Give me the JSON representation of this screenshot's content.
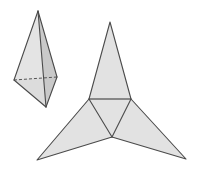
{
  "figure": {
    "title": "Tetrahedron and its net",
    "canvas": {
      "width": 197,
      "height": 181,
      "background": "#ffffff"
    },
    "style": {
      "edge_color": "#4a4a4a",
      "edge_width": 1,
      "face_light": "#e4e4e4",
      "face_mid": "#dcdcdc",
      "face_dark": "#c9c9c9",
      "face_net": "#e2e2e2",
      "hidden_edge_color": "#555555",
      "hidden_edge_dash": "3,2"
    },
    "solid": {
      "name": "tetrahedron-solid",
      "label": "tetrahedron",
      "vertices": {
        "apex": [
          38,
          11
        ],
        "left": [
          14,
          80
        ],
        "right": [
          57,
          77
        ],
        "front": [
          46,
          107
        ]
      },
      "faces": [
        {
          "name": "face-left",
          "points": "38,11 14,80 46,107",
          "fill": "#e4e4e4"
        },
        {
          "name": "face-right",
          "points": "38,11 46,107 57,77",
          "fill": "#c9c9c9"
        },
        {
          "name": "face-base-front",
          "points": "14,80 57,77 46,107",
          "fill": "#dcdcdc"
        }
      ],
      "visible_edges": [
        "38,11 14,80",
        "14,80 46,107",
        "46,107 38,11",
        "46,107 57,77",
        "57,77 38,11"
      ],
      "hidden_edges": [
        "14,80 57,77"
      ]
    },
    "net": {
      "name": "tetrahedron-net",
      "label": "net",
      "inner_triangle": {
        "points": "89,99 131,99 112,137",
        "fill": "#e2e2e2"
      },
      "flaps": [
        {
          "name": "flap-top",
          "points": "89,99 131,99 110,22",
          "fill": "#e2e2e2"
        },
        {
          "name": "flap-left",
          "points": "89,99 112,137 37,160",
          "fill": "#e2e2e2"
        },
        {
          "name": "flap-right",
          "points": "131,99 112,137 186,159",
          "fill": "#e2e2e2"
        }
      ],
      "fold_edges": [
        "89,99 131,99",
        "89,99 112,137",
        "131,99 112,137"
      ],
      "outline": "110,22 131,99 186,159 112,137 37,160 89,99"
    }
  }
}
